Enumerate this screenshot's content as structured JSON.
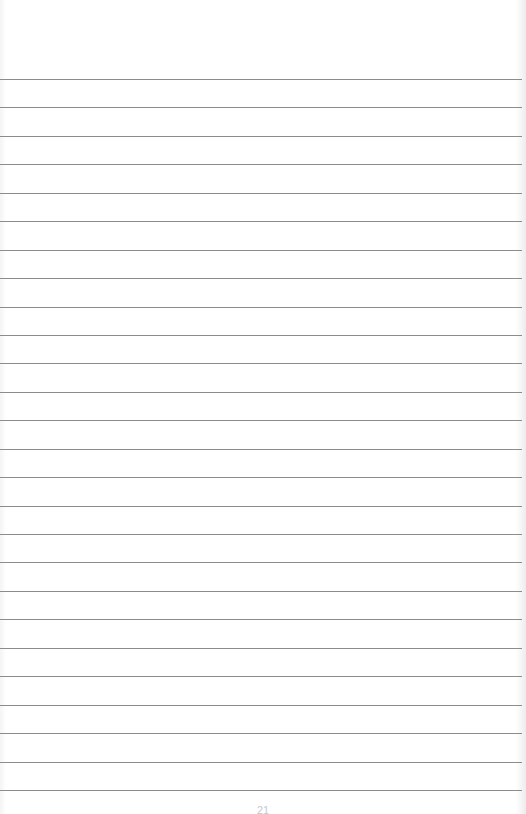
{
  "page": {
    "type": "lined-paper",
    "background_color": "#ffffff",
    "rule_color": "#8c8c8c",
    "first_rule_y": 79,
    "rule_spacing": 28.44,
    "rule_count": 26,
    "page_number": "21"
  }
}
